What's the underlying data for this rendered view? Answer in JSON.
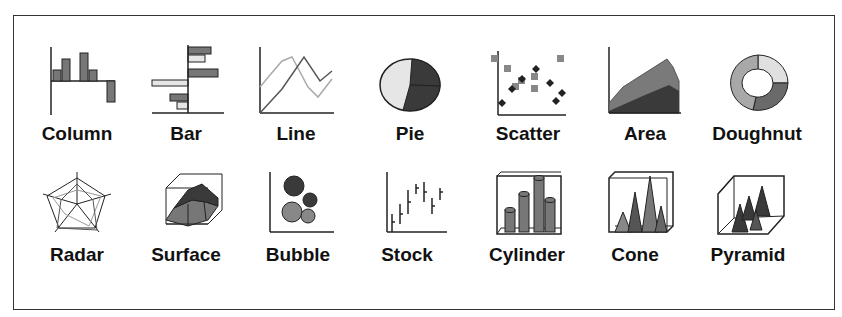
{
  "chart_types": {
    "row1": [
      {
        "label": "Column",
        "icon": "column-chart-icon"
      },
      {
        "label": "Bar",
        "icon": "bar-chart-icon"
      },
      {
        "label": "Line",
        "icon": "line-chart-icon"
      },
      {
        "label": "Pie",
        "icon": "pie-chart-icon"
      },
      {
        "label": "Scatter",
        "icon": "scatter-chart-icon"
      },
      {
        "label": "Area",
        "icon": "area-chart-icon"
      },
      {
        "label": "Doughnut",
        "icon": "doughnut-chart-icon"
      }
    ],
    "row2": [
      {
        "label": "Radar",
        "icon": "radar-chart-icon"
      },
      {
        "label": "Surface",
        "icon": "surface-chart-icon"
      },
      {
        "label": "Bubble",
        "icon": "bubble-chart-icon"
      },
      {
        "label": "Stock",
        "icon": "stock-chart-icon"
      },
      {
        "label": "Cylinder",
        "icon": "cylinder-chart-icon"
      },
      {
        "label": "Cone",
        "icon": "cone-chart-icon"
      },
      {
        "label": "Pyramid",
        "icon": "pyramid-chart-icon"
      }
    ]
  },
  "colors": {
    "dark": "#3a3a3a",
    "mid": "#7a7a7a",
    "light": "#e6e6e6",
    "border": "#333333"
  }
}
